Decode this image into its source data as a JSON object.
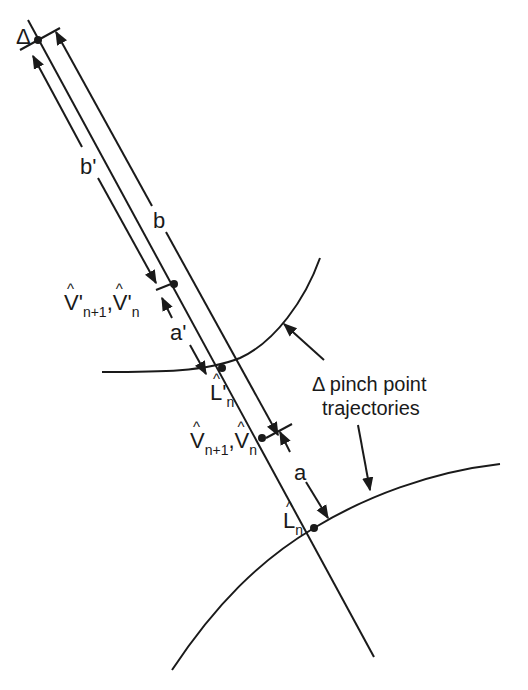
{
  "diagram": {
    "colors": {
      "stroke": "#1a1a1a",
      "background": "#ffffff"
    },
    "labels": {
      "delta_top": "Δ",
      "b_prime": "b'",
      "b": "b",
      "a_prime": "a'",
      "a": "a",
      "v_prime_pair": {
        "v1": "V'",
        "v1_sub": "n+1",
        "sep": ",",
        "v2": "V'",
        "v2_sub": "n"
      },
      "l_prime": {
        "main": "L'",
        "sub": "n"
      },
      "v_pair": {
        "v1": "V",
        "v1_sub": "n+1",
        "sep": ",",
        "v2": "V",
        "v2_sub": "n"
      },
      "l": {
        "main": "L",
        "sub": "n"
      },
      "annotation_line1": "Δ pinch point",
      "annotation_line2": "trajectories"
    },
    "points": [
      {
        "name": "delta",
        "x": 38,
        "y": 40
      },
      {
        "name": "v-prime-point",
        "x": 174,
        "y": 284
      },
      {
        "name": "l-prime-point",
        "x": 222,
        "y": 368
      },
      {
        "name": "v-point",
        "x": 262,
        "y": 438
      },
      {
        "name": "l-point",
        "x": 314,
        "y": 528
      }
    ]
  }
}
